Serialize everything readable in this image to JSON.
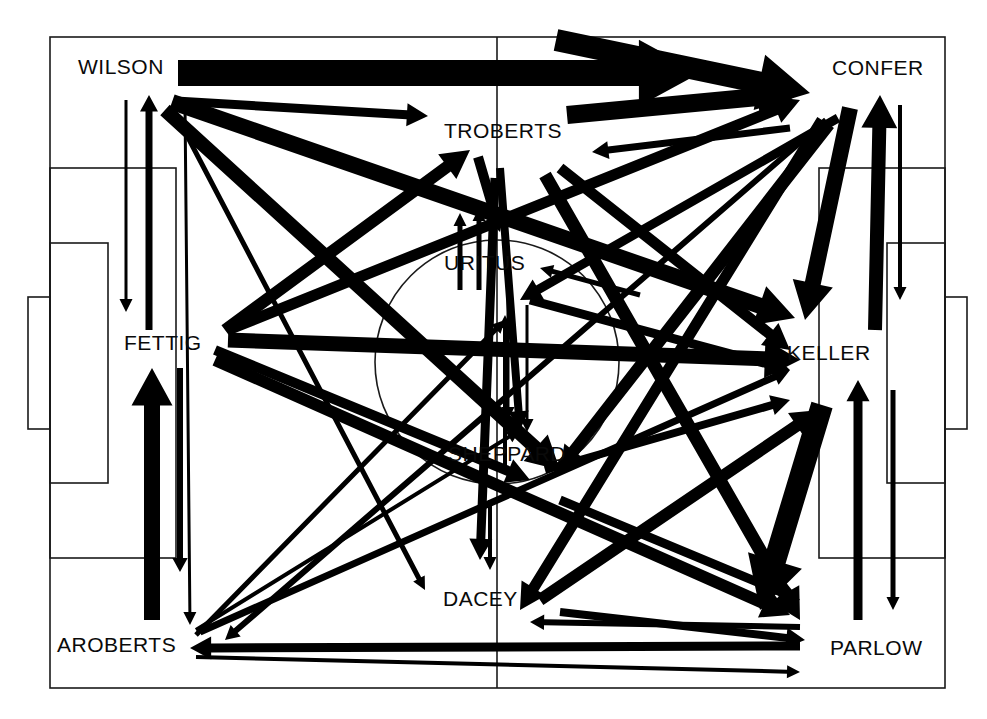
{
  "figure": {
    "kind": "soccer-passing-network",
    "background": "#ffffff",
    "ink": "#000000",
    "pitch_line_color": "#1a1a1a",
    "width": 987,
    "height": 719
  },
  "pitch": {
    "name": "soccer-pitch",
    "outline": {
      "x": 50,
      "y": 37,
      "w": 895,
      "h": 651
    },
    "halfway_line_x": 497,
    "center_circle": {
      "cx": 497,
      "cy": 362,
      "r": 122
    },
    "penalty_area_left": {
      "x": 50,
      "y": 168,
      "w": 126,
      "h": 390
    },
    "goal_area_left": {
      "x": 50,
      "y": 243,
      "w": 58,
      "h": 240
    },
    "goal_left": {
      "x": 28,
      "y": 297,
      "w": 22,
      "h": 132
    },
    "penalty_area_right": {
      "x": 819,
      "y": 168,
      "w": 126,
      "h": 390
    },
    "goal_area_right": {
      "x": 887,
      "y": 243,
      "w": 58,
      "h": 240
    },
    "goal_right": {
      "x": 945,
      "y": 297,
      "w": 22,
      "h": 132
    }
  },
  "players": [
    {
      "id": "WILSON",
      "label": "WILSON",
      "x": 185,
      "y": 95,
      "label_x": 78,
      "label_y": 56
    },
    {
      "id": "TROBERTS",
      "label": "TROBERTS",
      "x": 505,
      "y": 160,
      "label_x": 444,
      "label_y": 120
    },
    {
      "id": "CONFER",
      "label": "CONFER",
      "x": 862,
      "y": 98,
      "label_x": 832,
      "label_y": 57
    },
    {
      "id": "FETTIG",
      "label": "FETTIG",
      "x": 175,
      "y": 372,
      "label_x": 124,
      "label_y": 332
    },
    {
      "id": "URITUS",
      "label": "URITUS",
      "x": 497,
      "y": 292,
      "label_x": 444,
      "label_y": 252
    },
    {
      "id": "KELLER",
      "label": "KELLER",
      "x": 840,
      "y": 390,
      "label_x": 787,
      "label_y": 342
    },
    {
      "id": "SHEPPARD",
      "label": "SHEPPARD",
      "x": 510,
      "y": 487,
      "label_x": 448,
      "label_y": 443
    },
    {
      "id": "DACEY",
      "label": "DACEY",
      "x": 495,
      "y": 640,
      "label_x": 443,
      "label_y": 588
    },
    {
      "id": "AROBERTS",
      "label": "AROBERTS",
      "x": 190,
      "y": 680,
      "label_x": 57,
      "label_y": 634
    },
    {
      "id": "PARLOW",
      "label": "PARLOW",
      "x": 835,
      "y": 680,
      "label_x": 830,
      "label_y": 637
    }
  ],
  "chart_data": {
    "type": "network",
    "title": "",
    "node_labels": [
      "WILSON",
      "TROBERTS",
      "CONFER",
      "FETTIG",
      "URITUS",
      "KELLER",
      "SHEPPARD",
      "DACEY",
      "AROBERTS",
      "PARLOW"
    ],
    "edge_weight_units": "passes (arrow thickness)",
    "edges": [
      {
        "from": "WILSON",
        "to": "CONFER",
        "weight": 26,
        "width": 26,
        "x1": 178,
        "y1": 73,
        "x2": 700,
        "y2": 73
      },
      {
        "from": "WILSON",
        "to": "CONFER",
        "weight": 22,
        "width": 22,
        "x1": 556,
        "y1": 40,
        "x2": 810,
        "y2": 93
      },
      {
        "from": "WILSON",
        "to": "TROBERTS",
        "weight": 9,
        "width": 9,
        "x1": 176,
        "y1": 101,
        "x2": 428,
        "y2": 116
      },
      {
        "from": "WILSON",
        "to": "KELLER",
        "weight": 16,
        "width": 16,
        "x1": 172,
        "y1": 102,
        "x2": 795,
        "y2": 318
      },
      {
        "from": "WILSON",
        "to": "SHEPPARD",
        "weight": 14,
        "width": 14,
        "x1": 165,
        "y1": 110,
        "x2": 560,
        "y2": 470
      },
      {
        "from": "WILSON",
        "to": "DACEY",
        "weight": 5,
        "width": 5,
        "x1": 172,
        "y1": 107,
        "x2": 425,
        "y2": 590
      },
      {
        "from": "WILSON",
        "to": "AROBERTS",
        "weight": 3,
        "width": 3,
        "x1": 185,
        "y1": 105,
        "x2": 190,
        "y2": 625
      },
      {
        "from": "FETTIG",
        "to": "WILSON",
        "weight": 7,
        "width": 7,
        "x1": 149,
        "y1": 330,
        "x2": 149,
        "y2": 95
      },
      {
        "from": "WILSON",
        "to": "FETTIG",
        "weight": 3,
        "width": 3,
        "x1": 126,
        "y1": 100,
        "x2": 126,
        "y2": 312
      },
      {
        "from": "TROBERTS",
        "to": "CONFER",
        "weight": 18,
        "width": 18,
        "x1": 567,
        "y1": 115,
        "x2": 800,
        "y2": 93
      },
      {
        "from": "CONFER",
        "to": "TROBERTS",
        "weight": 7,
        "width": 7,
        "x1": 790,
        "y1": 128,
        "x2": 592,
        "y2": 152
      },
      {
        "from": "TROBERTS",
        "to": "URITUS",
        "weight": 10,
        "width": 10,
        "x1": 478,
        "y1": 157,
        "x2": 500,
        "y2": 232
      },
      {
        "from": "TROBERTS",
        "to": "SHEPPARD",
        "weight": 8,
        "width": 8,
        "x1": 500,
        "y1": 168,
        "x2": 520,
        "y2": 430
      },
      {
        "from": "TROBERTS",
        "to": "KELLER",
        "weight": 11,
        "width": 11,
        "x1": 560,
        "y1": 168,
        "x2": 790,
        "y2": 350
      },
      {
        "from": "TROBERTS",
        "to": "PARLOW",
        "weight": 13,
        "width": 13,
        "x1": 545,
        "y1": 175,
        "x2": 800,
        "y2": 620
      },
      {
        "from": "TROBERTS",
        "to": "DACEY",
        "weight": 9,
        "width": 9,
        "x1": 495,
        "y1": 178,
        "x2": 480,
        "y2": 560
      },
      {
        "from": "CONFER",
        "to": "KELLER",
        "weight": 16,
        "width": 16,
        "x1": 850,
        "y1": 108,
        "x2": 805,
        "y2": 320
      },
      {
        "from": "KELLER",
        "to": "CONFER",
        "weight": 14,
        "width": 14,
        "x1": 875,
        "y1": 330,
        "x2": 880,
        "y2": 95
      },
      {
        "from": "CONFER",
        "to": "KELLER",
        "weight": 4,
        "width": 4,
        "x1": 900,
        "y1": 105,
        "x2": 900,
        "y2": 300
      },
      {
        "from": "CONFER",
        "to": "URITUS",
        "weight": 9,
        "width": 9,
        "x1": 838,
        "y1": 118,
        "x2": 520,
        "y2": 300
      },
      {
        "from": "CONFER",
        "to": "SHEPPARD",
        "weight": 10,
        "width": 10,
        "x1": 830,
        "y1": 125,
        "x2": 560,
        "y2": 470
      },
      {
        "from": "CONFER",
        "to": "DACEY",
        "weight": 11,
        "width": 11,
        "x1": 822,
        "y1": 120,
        "x2": 520,
        "y2": 610
      },
      {
        "from": "CONFER",
        "to": "AROBERTS",
        "weight": 6,
        "width": 6,
        "x1": 826,
        "y1": 120,
        "x2": 225,
        "y2": 640
      },
      {
        "from": "FETTIG",
        "to": "TROBERTS",
        "weight": 12,
        "width": 12,
        "x1": 225,
        "y1": 330,
        "x2": 470,
        "y2": 150
      },
      {
        "from": "FETTIG",
        "to": "CONFER",
        "weight": 11,
        "width": 11,
        "x1": 228,
        "y1": 330,
        "x2": 800,
        "y2": 100
      },
      {
        "from": "FETTIG",
        "to": "KELLER",
        "weight": 15,
        "width": 15,
        "x1": 228,
        "y1": 340,
        "x2": 800,
        "y2": 360
      },
      {
        "from": "FETTIG",
        "to": "SHEPPARD",
        "weight": 10,
        "width": 10,
        "x1": 215,
        "y1": 350,
        "x2": 530,
        "y2": 480
      },
      {
        "from": "FETTIG",
        "to": "PARLOW",
        "weight": 12,
        "width": 12,
        "x1": 215,
        "y1": 360,
        "x2": 790,
        "y2": 615
      },
      {
        "from": "AROBERTS",
        "to": "FETTIG",
        "weight": 16,
        "width": 16,
        "x1": 152,
        "y1": 620,
        "x2": 152,
        "y2": 368
      },
      {
        "from": "FETTIG",
        "to": "AROBERTS",
        "weight": 6,
        "width": 6,
        "x1": 180,
        "y1": 368,
        "x2": 180,
        "y2": 572
      },
      {
        "from": "URITUS",
        "to": "TROBERTS",
        "weight": 5,
        "width": 5,
        "x1": 460,
        "y1": 290,
        "x2": 460,
        "y2": 213
      },
      {
        "from": "URITUS",
        "to": "TROBERTS",
        "weight": 5,
        "width": 5,
        "x1": 479,
        "y1": 290,
        "x2": 479,
        "y2": 208
      },
      {
        "from": "URITUS",
        "to": "SHEPPARD",
        "weight": 3,
        "width": 3,
        "x1": 508,
        "y1": 300,
        "x2": 508,
        "y2": 420
      },
      {
        "from": "URITUS",
        "to": "DACEY",
        "weight": 3,
        "width": 3,
        "x1": 527,
        "y1": 305,
        "x2": 527,
        "y2": 432
      },
      {
        "from": "URITUS",
        "to": "KELLER",
        "weight": 9,
        "width": 9,
        "x1": 530,
        "y1": 300,
        "x2": 790,
        "y2": 370
      },
      {
        "from": "KELLER",
        "to": "URITUS",
        "weight": 5,
        "width": 5,
        "x1": 640,
        "y1": 295,
        "x2": 540,
        "y2": 268
      },
      {
        "from": "SHEPPARD",
        "to": "URITUS",
        "weight": 4,
        "width": 4,
        "x1": 505,
        "y1": 470,
        "x2": 505,
        "y2": 315
      },
      {
        "from": "SHEPPARD",
        "to": "KELLER",
        "weight": 8,
        "width": 8,
        "x1": 545,
        "y1": 470,
        "x2": 790,
        "y2": 400
      },
      {
        "from": "SHEPPARD",
        "to": "CONFER",
        "weight": 7,
        "width": 7,
        "x1": 560,
        "y1": 465,
        "x2": 820,
        "y2": 130
      },
      {
        "from": "SHEPPARD",
        "to": "DACEY",
        "weight": 4,
        "width": 4,
        "x1": 490,
        "y1": 500,
        "x2": 490,
        "y2": 570
      },
      {
        "from": "SHEPPARD",
        "to": "PARLOW",
        "weight": 9,
        "width": 9,
        "x1": 560,
        "y1": 500,
        "x2": 800,
        "y2": 600
      },
      {
        "from": "DACEY",
        "to": "KELLER",
        "weight": 12,
        "width": 12,
        "x1": 540,
        "y1": 600,
        "x2": 820,
        "y2": 410
      },
      {
        "from": "DACEY",
        "to": "PARLOW",
        "weight": 8,
        "width": 8,
        "x1": 560,
        "y1": 612,
        "x2": 805,
        "y2": 640
      },
      {
        "from": "KELLER",
        "to": "PARLOW",
        "weight": 22,
        "width": 22,
        "x1": 822,
        "y1": 405,
        "x2": 760,
        "y2": 610
      },
      {
        "from": "PARLOW",
        "to": "KELLER",
        "weight": 9,
        "width": 9,
        "x1": 858,
        "y1": 620,
        "x2": 858,
        "y2": 380
      },
      {
        "from": "KELLER",
        "to": "PARLOW",
        "weight": 5,
        "width": 5,
        "x1": 893,
        "y1": 390,
        "x2": 893,
        "y2": 610
      },
      {
        "from": "PARLOW",
        "to": "DACEY",
        "weight": 6,
        "width": 6,
        "x1": 800,
        "y1": 627,
        "x2": 530,
        "y2": 622
      },
      {
        "from": "PARLOW",
        "to": "AROBERTS",
        "weight": 9,
        "width": 9,
        "x1": 800,
        "y1": 646,
        "x2": 190,
        "y2": 648
      },
      {
        "from": "AROBERTS",
        "to": "PARLOW",
        "weight": 4,
        "width": 4,
        "x1": 196,
        "y1": 657,
        "x2": 800,
        "y2": 672
      },
      {
        "from": "AROBERTS",
        "to": "SHEPPARD",
        "weight": 4,
        "width": 4,
        "x1": 196,
        "y1": 630,
        "x2": 520,
        "y2": 430
      },
      {
        "from": "AROBERTS",
        "to": "URITUS",
        "weight": 5,
        "width": 5,
        "x1": 196,
        "y1": 635,
        "x2": 505,
        "y2": 320
      },
      {
        "from": "AROBERTS",
        "to": "KELLER",
        "weight": 7,
        "width": 7,
        "x1": 200,
        "y1": 632,
        "x2": 790,
        "y2": 370
      }
    ]
  }
}
